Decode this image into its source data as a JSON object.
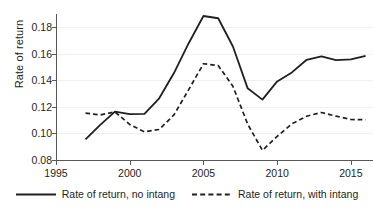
{
  "chart_data": {
    "type": "line",
    "title": "",
    "xlabel": "",
    "ylabel": "Rate of return",
    "xlim": [
      1995,
      2016.5
    ],
    "ylim": [
      0.08,
      0.19
    ],
    "grid": true,
    "legend_position": "bottom",
    "x_ticks": [
      "1995",
      "2000",
      "2005",
      "2010",
      "2015"
    ],
    "x_tick_values": [
      1995,
      2000,
      2005,
      2010,
      2015
    ],
    "y_ticks": [
      "0.08",
      "0.10",
      "0.12",
      "0.14",
      "0.16",
      "0.18"
    ],
    "y_tick_values": [
      0.08,
      0.1,
      0.12,
      0.14,
      0.16,
      0.18
    ],
    "x": [
      1997,
      1998,
      1999,
      2000,
      2001,
      2002,
      2003,
      2004,
      2005,
      2006,
      2007,
      2008,
      2009,
      2010,
      2011,
      2012,
      2013,
      2014,
      2015,
      2016
    ],
    "series": [
      {
        "name": "Rate of return, no intang",
        "style": "solid",
        "color": "#231f20",
        "values": [
          0.0955,
          0.1065,
          0.1165,
          0.1145,
          0.1148,
          0.1265,
          0.1455,
          0.168,
          0.1885,
          0.1868,
          0.1655,
          0.134,
          0.1255,
          0.1392,
          0.146,
          0.1555,
          0.158,
          0.1552,
          0.1558,
          0.1585
        ]
      },
      {
        "name": "Rate of return, with intang",
        "style": "dashed",
        "color": "#231f20",
        "values": [
          0.1153,
          0.114,
          0.1162,
          0.1068,
          0.1012,
          0.103,
          0.114,
          0.133,
          0.1525,
          0.1512,
          0.1355,
          0.107,
          0.0873,
          0.0978,
          0.1072,
          0.113,
          0.1158,
          0.113,
          0.1105,
          0.1103
        ]
      }
    ]
  },
  "legend": {
    "items": [
      {
        "label": "Rate of return, no intang",
        "style": "solid"
      },
      {
        "label": "Rate of return, with intang",
        "style": "dashed"
      }
    ]
  }
}
